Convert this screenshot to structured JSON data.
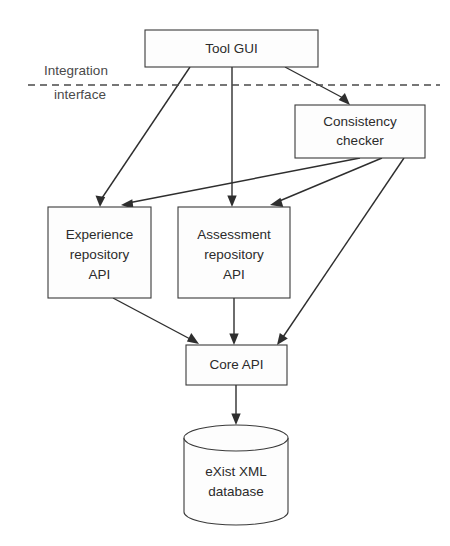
{
  "diagram": {
    "background_color": "#ffffff",
    "stroke_color": "#2e2e2e",
    "node_fill_color": "#fdfdfd",
    "text_color": "#2b2b2b",
    "boundary": {
      "label_line1": "Integration",
      "label_line2": "interface",
      "style": "dashed",
      "color": "#4a4a4a",
      "y": 85,
      "x_start": 28,
      "x_end": 440
    },
    "nodes": [
      {
        "id": "tool-gui",
        "label": "Tool GUI",
        "lines": [
          "Tool GUI"
        ],
        "shape": "rectangle",
        "x": 145,
        "y": 30,
        "w": 173,
        "h": 37
      },
      {
        "id": "consistency-checker",
        "label": "Consistency checker",
        "lines": [
          "Consistency",
          "checker"
        ],
        "shape": "rectangle",
        "x": 295,
        "y": 105,
        "w": 130,
        "h": 53
      },
      {
        "id": "experience-repository-api",
        "label": "Experience repository API",
        "lines": [
          "Experience",
          "repository",
          "API"
        ],
        "shape": "rectangle",
        "x": 48,
        "y": 207,
        "w": 103,
        "h": 91
      },
      {
        "id": "assessment-repository-api",
        "label": "Assessment repository API",
        "lines": [
          "Assessment",
          "repository",
          "API"
        ],
        "shape": "rectangle",
        "x": 178,
        "y": 207,
        "w": 112,
        "h": 91
      },
      {
        "id": "core-api",
        "label": "Core API",
        "lines": [
          "Core API"
        ],
        "shape": "rectangle",
        "x": 186,
        "y": 345,
        "w": 101,
        "h": 40
      },
      {
        "id": "exist-xml-database",
        "label": "eXist XML database",
        "lines": [
          "eXist XML",
          "database"
        ],
        "shape": "cylinder",
        "x": 184,
        "y": 425,
        "w": 104,
        "h": 100
      }
    ],
    "edges": [
      {
        "id": "edge-toolgui-experience",
        "from": "tool-gui",
        "to": "experience-repository-api",
        "arrow": "to"
      },
      {
        "id": "edge-toolgui-assessment",
        "from": "tool-gui",
        "to": "assessment-repository-api",
        "arrow": "to"
      },
      {
        "id": "edge-toolgui-consistency",
        "from": "tool-gui",
        "to": "consistency-checker",
        "arrow": "to"
      },
      {
        "id": "edge-consistency-experience",
        "from": "consistency-checker",
        "to": "experience-repository-api",
        "arrow": "to"
      },
      {
        "id": "edge-consistency-assessment",
        "from": "consistency-checker",
        "to": "assessment-repository-api",
        "arrow": "to"
      },
      {
        "id": "edge-consistency-core",
        "from": "consistency-checker",
        "to": "core-api",
        "arrow": "to"
      },
      {
        "id": "edge-experience-core",
        "from": "experience-repository-api",
        "to": "core-api",
        "arrow": "to"
      },
      {
        "id": "edge-assessment-core",
        "from": "assessment-repository-api",
        "to": "core-api",
        "arrow": "to"
      },
      {
        "id": "edge-core-database",
        "from": "core-api",
        "to": "exist-xml-database",
        "arrow": "to"
      }
    ]
  }
}
